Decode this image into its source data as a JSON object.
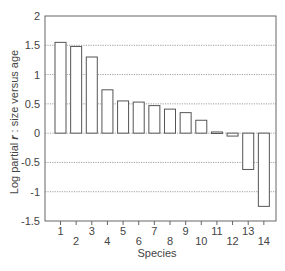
{
  "chart_data": {
    "type": "bar",
    "title": "",
    "xlabel": "Species",
    "ylabel": "Log partial r : size versus age",
    "ylabel_parts": {
      "before": "Log partial ",
      "symbol": "r",
      "after": " : size versus age"
    },
    "categories": [
      "1",
      "2",
      "3",
      "4",
      "5",
      "6",
      "7",
      "8",
      "9",
      "10",
      "11",
      "12",
      "13",
      "14"
    ],
    "values": [
      1.55,
      1.48,
      1.3,
      0.74,
      0.55,
      0.53,
      0.47,
      0.41,
      0.35,
      0.22,
      0.02,
      -0.05,
      -0.62,
      -1.25
    ],
    "ylim": [
      -1.5,
      2
    ],
    "yticks": [
      -1.5,
      -1,
      -0.5,
      0,
      0.5,
      1,
      1.5,
      2
    ],
    "ytick_labels": [
      "-1.5",
      "-1",
      "-0.5",
      "0",
      "0.5",
      "1",
      "1.5",
      "2"
    ],
    "grid": {
      "y": true,
      "style": "dotted",
      "x": false
    },
    "legend": null,
    "bar_fill": "#ffffff",
    "bar_stroke": "#555555"
  }
}
